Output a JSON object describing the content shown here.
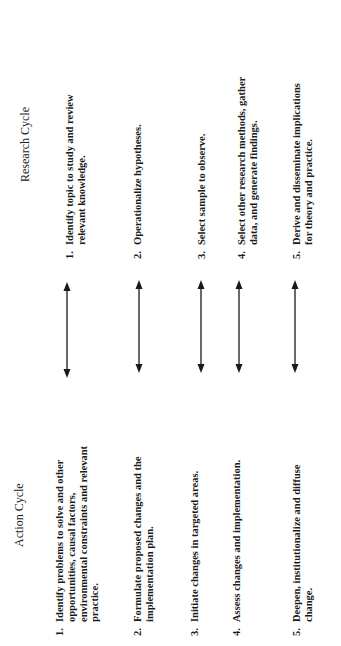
{
  "action_cycle": {
    "title": "Action Cycle",
    "items": [
      {
        "num": "1.",
        "lines": [
          "Identify problems to solve and other",
          "opportunities, causal factors,",
          "environmental constraints and relevant",
          "practice."
        ]
      },
      {
        "num": "2.",
        "lines": [
          "Formulate proposed changes and the",
          "implementation plan."
        ]
      },
      {
        "num": "3.",
        "lines": [
          "Initiate changes in targeted areas."
        ]
      },
      {
        "num": "4.",
        "lines": [
          "Assess changes and implementation."
        ]
      },
      {
        "num": "5.",
        "lines": [
          "Deepen, institutionalize and diffuse",
          "change."
        ]
      }
    ]
  },
  "research_cycle": {
    "title": "Research Cycle",
    "items": [
      {
        "num": "1.",
        "lines": [
          "Identify topic to study and review",
          "relevant knowledge."
        ]
      },
      {
        "num": "2.",
        "lines": [
          "Operationalize hypotheses."
        ]
      },
      {
        "num": "3.",
        "lines": [
          "Select sample to observe."
        ]
      },
      {
        "num": "4.",
        "lines": [
          "Select other research methods, gather",
          "data, and generate findings."
        ]
      },
      {
        "num": "5.",
        "lines": [
          "Derive and disseminate implications",
          "for theory and practice."
        ]
      }
    ]
  },
  "connectors": {
    "type": "double-headed-arrow",
    "count": 5,
    "color": "#1a1a1a"
  }
}
